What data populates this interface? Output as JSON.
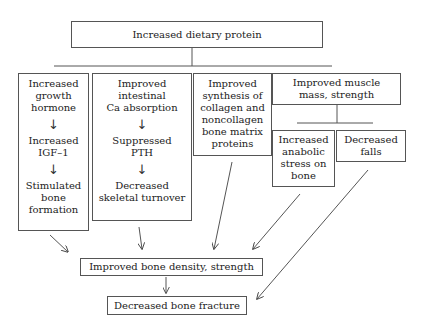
{
  "diagram": {
    "title_box": "Increased dietary protein",
    "branches": [
      {
        "id": "growth-hormone",
        "steps": [
          "Increased\ngrowth\nhormone",
          "Increased\nIGF–1",
          "Stimulated\nbone\nformation"
        ]
      },
      {
        "id": "calcium",
        "steps": [
          "Improved\nintestinal\nCa absorption",
          "Suppressed\nPTH",
          "Decreased\nskeletal turnover"
        ]
      },
      {
        "id": "collagen",
        "steps": [
          "Improved\nsynthesis of\ncollagen and\nnoncollagen\nbone matrix\nproteins"
        ]
      },
      {
        "id": "muscle",
        "label": "Improved muscle\nmass, strength",
        "children": [
          "Increased\nanabolic\nstress on\nbone",
          "Decreased\nfalls"
        ]
      }
    ],
    "arrow_glyph": "↓",
    "outcome_1": "Improved bone density, strength",
    "outcome_2": "Decreased bone fracture",
    "edges": [
      {
        "from": "Increased dietary protein",
        "to": "all branches"
      },
      {
        "from": "Increased growth hormone",
        "to": "Increased IGF–1"
      },
      {
        "from": "Increased IGF–1",
        "to": "Stimulated bone formation"
      },
      {
        "from": "Improved intestinal Ca absorption",
        "to": "Suppressed PTH"
      },
      {
        "from": "Suppressed PTH",
        "to": "Decreased skeletal turnover"
      },
      {
        "from": "Improved muscle mass, strength",
        "to": "Increased anabolic stress on bone"
      },
      {
        "from": "Improved muscle mass, strength",
        "to": "Decreased falls"
      },
      {
        "from": "Stimulated bone formation",
        "to": "Improved bone density, strength"
      },
      {
        "from": "Decreased skeletal turnover",
        "to": "Improved bone density, strength"
      },
      {
        "from": "Improved synthesis of collagen and noncollagen bone matrix proteins",
        "to": "Improved bone density, strength"
      },
      {
        "from": "Increased anabolic stress on bone",
        "to": "Improved bone density, strength"
      },
      {
        "from": "Improved bone density, strength",
        "to": "Decreased bone fracture"
      },
      {
        "from": "Decreased falls",
        "to": "Decreased bone fracture"
      }
    ]
  }
}
